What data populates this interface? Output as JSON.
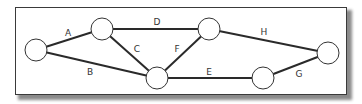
{
  "diagram": {
    "type": "network-graph",
    "nodes": [
      {
        "id": "n1",
        "x": 36,
        "y": 50,
        "r": 11
      },
      {
        "id": "n2",
        "x": 102,
        "y": 29,
        "r": 11
      },
      {
        "id": "n3",
        "x": 157,
        "y": 78,
        "r": 11
      },
      {
        "id": "n4",
        "x": 209,
        "y": 29,
        "r": 11
      },
      {
        "id": "n5",
        "x": 263,
        "y": 78,
        "r": 11
      },
      {
        "id": "n6",
        "x": 328,
        "y": 53,
        "r": 11
      }
    ],
    "edges": [
      {
        "label": "A",
        "from": "n1",
        "to": "n2",
        "label_x": 68,
        "label_y": 36
      },
      {
        "label": "B",
        "from": "n1",
        "to": "n3",
        "label_x": 90,
        "label_y": 75
      },
      {
        "label": "C",
        "from": "n2",
        "to": "n3",
        "label_x": 137,
        "label_y": 52
      },
      {
        "label": "D",
        "from": "n2",
        "to": "n4",
        "label_x": 157,
        "label_y": 25
      },
      {
        "label": "E",
        "from": "n3",
        "to": "n5",
        "label_x": 209,
        "label_y": 75
      },
      {
        "label": "F",
        "from": "n3",
        "to": "n4",
        "label_x": 177,
        "label_y": 52
      },
      {
        "label": "G",
        "from": "n5",
        "to": "n6",
        "label_x": 299,
        "label_y": 77
      },
      {
        "label": "H",
        "from": "n4",
        "to": "n6",
        "label_x": 264,
        "label_y": 35
      }
    ],
    "colors": {
      "edge": "#2a2a2a",
      "node_stroke": "#333333",
      "node_fill": "#ffffff",
      "frame_border": "#3a3a3a"
    }
  }
}
